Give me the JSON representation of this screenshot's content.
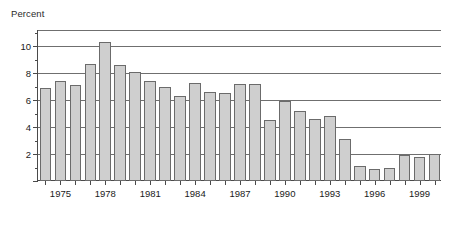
{
  "chart_data": {
    "type": "bar",
    "title": "",
    "subtitle": "",
    "ylabel": "Percent",
    "xlabel": "",
    "ylim": [
      0,
      11.2
    ],
    "yticks": [
      0,
      2,
      4,
      6,
      8,
      10
    ],
    "ytick_labels": [
      "",
      "2",
      "4",
      "6",
      "8",
      "10"
    ],
    "yminor_ticks": [
      1,
      3,
      5,
      7,
      9,
      11
    ],
    "grid": true,
    "grid_axis": "y",
    "legend": null,
    "legend_position": "none",
    "bar_color": "#cfcfcf",
    "bar_edge_color": "#6b6b6b",
    "axis_color": "#4a4a4a",
    "categories": [
      "1974",
      "1975",
      "1976",
      "1977",
      "1978",
      "1979",
      "1980",
      "1981",
      "1982",
      "1983",
      "1984",
      "1985",
      "1986",
      "1987",
      "1988",
      "1989",
      "1990",
      "1991",
      "1992",
      "1993",
      "1994",
      "1995",
      "1996",
      "1997",
      "1998",
      "1999",
      "2000"
    ],
    "values": [
      6.9,
      7.4,
      7.1,
      8.7,
      10.3,
      8.6,
      8.1,
      7.4,
      7.0,
      6.3,
      7.3,
      6.6,
      6.5,
      7.2,
      7.2,
      4.5,
      5.9,
      5.2,
      4.6,
      4.8,
      3.1,
      1.1,
      0.9,
      1.0,
      1.9,
      1.8,
      2.0
    ],
    "xtick_labels": [
      "1975",
      "1978",
      "1981",
      "1984",
      "1987",
      "1990",
      "1993",
      "1996",
      "1999"
    ],
    "xtick_categories": [
      "1975",
      "1978",
      "1981",
      "1984",
      "1987",
      "1990",
      "1993",
      "1996",
      "1999"
    ]
  }
}
